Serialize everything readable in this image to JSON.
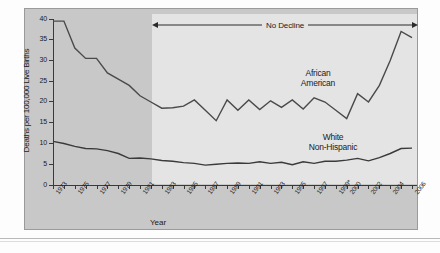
{
  "chart_data": {
    "type": "line",
    "title": "",
    "xlabel": "Year",
    "ylabel": "Deaths per 100,000 Live Births",
    "ylim": [
      0,
      40
    ],
    "yticks": [
      0,
      5,
      10,
      15,
      20,
      25,
      30,
      35,
      40
    ],
    "grid": false,
    "xlim": [
      1973,
      2006
    ],
    "x": [
      1973,
      1974,
      1975,
      1976,
      1977,
      1978,
      1979,
      1980,
      1981,
      1982,
      1983,
      1984,
      1985,
      1986,
      1987,
      1988,
      1989,
      1990,
      1991,
      1992,
      1993,
      1994,
      1995,
      1996,
      1997,
      1998,
      1999,
      2000,
      2001,
      2002,
      2003,
      2004,
      2005,
      2006
    ],
    "xtick_labels": [
      "1973",
      "1975",
      "1977",
      "1979",
      "1981",
      "1983",
      "1985",
      "1987",
      "1989",
      "1991",
      "1993",
      "1995",
      "1997",
      "1999*",
      "2000",
      "2002",
      "2004",
      "2006"
    ],
    "annotations": [
      {
        "text": "No Decline",
        "type": "double-arrow-span",
        "from_year": 1982,
        "to_year": 2006
      }
    ],
    "series": [
      {
        "name": "African American",
        "color": "#4a4a4a",
        "values": [
          39.5,
          39.5,
          33.0,
          30.5,
          30.5,
          27.0,
          25.5,
          24.0,
          21.5,
          20.0,
          18.5,
          18.6,
          19.0,
          20.5,
          18.0,
          15.5,
          20.5,
          18.0,
          20.5,
          18.2,
          20.3,
          18.7,
          20.5,
          18.3,
          21.0,
          20.0,
          18.0,
          16.0,
          22.0,
          20.0,
          24.0,
          30.0,
          37.0,
          35.5
        ]
      },
      {
        "name": "White Non-Hispanic",
        "color": "#3a3a3a",
        "values": [
          10.5,
          10.0,
          9.3,
          8.8,
          8.7,
          8.3,
          7.6,
          6.4,
          6.5,
          6.3,
          5.9,
          5.7,
          5.4,
          5.2,
          4.8,
          5.0,
          5.2,
          5.3,
          5.2,
          5.6,
          5.2,
          5.5,
          4.9,
          5.6,
          5.2,
          5.7,
          5.7,
          6.0,
          6.4,
          5.8,
          6.6,
          7.6,
          8.8,
          8.9
        ]
      }
    ]
  },
  "labels": {
    "ytitle": "Deaths per 100,000 Live Births",
    "xtitle": "Year",
    "no_decline": "No Decline",
    "african_american_line1": "African",
    "african_american_line2": "American",
    "white_line1": "White",
    "white_line2": "Non-Hispanic"
  },
  "colors": {
    "figure_background": "#c8c8c8",
    "band": "#e4e4e4",
    "african_american": "#4a4a4a",
    "white_non_hispanic": "#3a3a3a",
    "axis": "#3a3a3a"
  }
}
